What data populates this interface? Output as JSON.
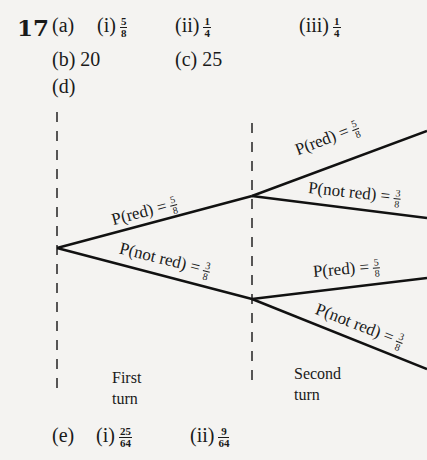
{
  "question_number": "17",
  "part_a": {
    "label": "(a)",
    "items": [
      {
        "label": "(i)",
        "num": "5",
        "den": "8"
      },
      {
        "label": "(ii)",
        "num": "1",
        "den": "4"
      },
      {
        "label": "(iii)",
        "num": "1",
        "den": "4"
      }
    ]
  },
  "part_b": {
    "label": "(b)",
    "value": "20"
  },
  "part_c": {
    "label": "(c)",
    "value": "25"
  },
  "part_d": {
    "label": "(d)"
  },
  "tree": {
    "first_turn": {
      "red": {
        "text": "P(red) =",
        "num": "5",
        "den": "8"
      },
      "not_red": {
        "text": "P(not red) =",
        "num": "3",
        "den": "8"
      }
    },
    "second_turn_upper": {
      "red": {
        "text": "P(red) =",
        "num": "5",
        "den": "8"
      },
      "not_red": {
        "text": "P(not red) =",
        "num": "3",
        "den": "8"
      }
    },
    "second_turn_lower": {
      "red": {
        "text": "P(red) =",
        "num": "5",
        "den": "8"
      },
      "not_red": {
        "text": "P(not red) =",
        "num": "3",
        "den": "8"
      }
    },
    "labels": {
      "first": [
        "First",
        "turn"
      ],
      "second": [
        "Second",
        "turn"
      ]
    },
    "line_color": "#111111"
  },
  "part_e": {
    "label": "(e)",
    "items": [
      {
        "label": "(i)",
        "num": "25",
        "den": "64"
      },
      {
        "label": "(ii)",
        "num": "9",
        "den": "64"
      }
    ]
  }
}
